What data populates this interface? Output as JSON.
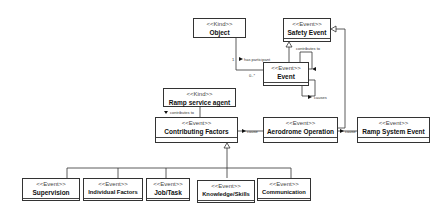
{
  "diagram": {
    "type": "UML class diagram",
    "nodes": {
      "object": {
        "stereotype": "<<Kind>>",
        "name": "Object"
      },
      "safety_event": {
        "stereotype": "<<Event>>",
        "name": "Safety Event"
      },
      "event": {
        "stereotype": "<<Event>>",
        "name": "Event"
      },
      "ramp_service_agent": {
        "stereotype": "<<Kind>>",
        "name": "Ramp service agent"
      },
      "contributing_factors": {
        "stereotype": "<<Event>>",
        "name": "Contributing Factors"
      },
      "aerodrome_operation": {
        "stereotype": "<<Event>>",
        "name": "Aerodrome Operation"
      },
      "ramp_system_event": {
        "stereotype": "<<Event>>",
        "name": "Ramp System Event"
      },
      "supervision": {
        "stereotype": "<<Event>>",
        "name": "Supervision"
      },
      "individual_factors": {
        "stereotype": "<<Event>>",
        "name": "Individual Factors"
      },
      "job_task": {
        "stereotype": "<<Event>>",
        "name": "Job/Task"
      },
      "knowledge_skills": {
        "stereotype": "<<Event>>",
        "name": "Knowledge/Skills"
      },
      "communication": {
        "stereotype": "<<Event>>",
        "name": "Communication"
      }
    },
    "labels": {
      "has_participant": "has participant",
      "mult_1": "1",
      "mult_0_many": "0..*",
      "contributes_to_top": "contributes to",
      "causes_self": "causes",
      "contributes_to_left": "contributes to",
      "cause_cf": "cause",
      "cause_rse": "cause"
    },
    "edges": [
      {
        "from": "Object",
        "to": "Event",
        "label": "has participant",
        "multiplicity": [
          "1",
          "0..*"
        ]
      },
      {
        "from": "Event",
        "to": "Safety Event",
        "kind": "generalization"
      },
      {
        "from": "Event",
        "to": "Safety Event",
        "label": "contributes to"
      },
      {
        "from": "Event",
        "to": "Event",
        "label": "causes"
      },
      {
        "from": "Ramp service agent",
        "to": "Contributing Factors",
        "label": "contributes to"
      },
      {
        "from": "Aerodrome Operation",
        "to": "Contributing Factors",
        "label": "cause"
      },
      {
        "from": "Aerodrome Operation",
        "to": "Ramp System Event",
        "label": "cause"
      },
      {
        "from": "Aerodrome Operation",
        "to": "Safety Event",
        "kind": "generalization"
      },
      {
        "from": "Supervision",
        "to": "Contributing Factors",
        "kind": "generalization"
      },
      {
        "from": "Individual Factors",
        "to": "Contributing Factors",
        "kind": "generalization"
      },
      {
        "from": "Job/Task",
        "to": "Contributing Factors",
        "kind": "generalization"
      },
      {
        "from": "Knowledge/Skills",
        "to": "Contributing Factors",
        "kind": "generalization"
      },
      {
        "from": "Communication",
        "to": "Contributing Factors",
        "kind": "generalization"
      }
    ]
  }
}
